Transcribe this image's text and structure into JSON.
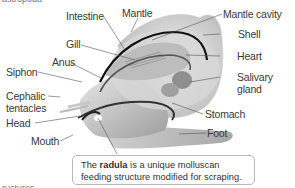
{
  "figure": {
    "top_cropped_text": "astropoda",
    "bottom_cropped_text": "ructures",
    "labels": {
      "intestine": "Intestine",
      "mantle": "Mantle",
      "mantle_cavity": "Mantle cavity",
      "shell": "Shell",
      "gill": "Gill",
      "heart": "Heart",
      "anus": "Anus",
      "salivary_gland_1": "Salivary",
      "salivary_gland_2": "gland",
      "siphon": "Siphon",
      "cephalic_tentacles_1": "Cephalic",
      "cephalic_tentacles_2": "tentacles",
      "head": "Head",
      "stomach": "Stomach",
      "mouth": "Mouth",
      "foot": "Foot"
    },
    "callout": {
      "pre": "The ",
      "bold": "radula",
      "post": " is a unique molluscan feeding structure modified for scraping."
    }
  }
}
